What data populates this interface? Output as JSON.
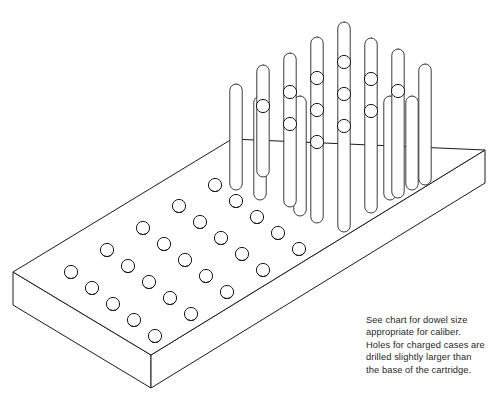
{
  "figure": {
    "caption": {
      "lines": [
        "See chart for dowel size",
        "appropriate for caliber.",
        "Holes for charged cases are",
        "drilled slightly larger than",
        "the base of the cartridge."
      ],
      "text": "See chart for dowel size\nappropriate for caliber.\nHoles for charged cases are\ndrilled slightly larger than\nthe base of the cartridge."
    },
    "colors": {
      "line": "#1a1a1a",
      "dowel_line": "#3a3a3a",
      "fill": "#ffffff",
      "background": "#ffffff",
      "text": "#1f1f1f"
    },
    "board": {
      "label": "loading block",
      "thickness_px": 33,
      "top_face_corners": [
        [
          13,
          272
        ],
        [
          232,
          139
        ],
        [
          485,
          150
        ],
        [
          151,
          355
        ]
      ],
      "front_left_edge": [
        [
          13,
          272
        ],
        [
          13,
          305
        ]
      ],
      "front_bottom_vertex": [
        151,
        388
      ],
      "right_vertex_bottom": [
        485,
        183
      ]
    },
    "holes": {
      "label": "drilled holes for charged cases",
      "count": 25,
      "radius_px": 6.6,
      "depth_arc_offset_px": 3.4,
      "grid_rows": 5,
      "grid_cols": 5,
      "centers": [
        [
          71,
          272
        ],
        [
          107,
          250
        ],
        [
          143,
          228
        ],
        [
          179,
          206
        ],
        [
          215,
          185
        ],
        [
          92,
          288
        ],
        [
          128,
          266
        ],
        [
          164,
          244
        ],
        [
          200,
          222
        ],
        [
          236,
          201
        ],
        [
          113,
          304
        ],
        [
          149,
          282
        ],
        [
          185,
          260
        ],
        [
          221,
          238
        ],
        [
          257,
          217
        ],
        [
          134,
          320
        ],
        [
          170,
          298
        ],
        [
          206,
          276
        ],
        [
          242,
          254
        ],
        [
          278,
          233
        ],
        [
          155,
          336
        ],
        [
          191,
          314
        ],
        [
          227,
          292
        ],
        [
          263,
          270
        ],
        [
          299,
          249
        ]
      ]
    },
    "dowels": {
      "label": "dowel pegs holding cartridge cases",
      "count": 12,
      "radius_px": 6.2,
      "items": [
        {
          "x": 236,
          "top_y": 84,
          "bottom_y": 190,
          "cases": []
        },
        {
          "x": 263,
          "top_y": 65,
          "bottom_y": 177,
          "cases": [
            106
          ]
        },
        {
          "x": 290,
          "top_y": 53,
          "bottom_y": 207,
          "cases": [
            92,
            124
          ]
        },
        {
          "x": 317,
          "top_y": 37,
          "bottom_y": 223,
          "cases": [
            78,
            110,
            142
          ]
        },
        {
          "x": 344,
          "top_y": 22,
          "bottom_y": 232,
          "cases": [
            62,
            94,
            126
          ]
        },
        {
          "x": 371,
          "top_y": 38,
          "bottom_y": 213,
          "cases": [
            79,
            111
          ]
        },
        {
          "x": 398,
          "top_y": 49,
          "bottom_y": 198,
          "cases": [
            91
          ]
        },
        {
          "x": 425,
          "top_y": 64,
          "bottom_y": 185,
          "cases": []
        },
        {
          "x": 260,
          "top_y": 100,
          "bottom_y": 200,
          "cases": []
        },
        {
          "x": 300,
          "top_y": 100,
          "bottom_y": 216,
          "cases": []
        },
        {
          "x": 390,
          "top_y": 100,
          "bottom_y": 200,
          "cases": []
        },
        {
          "x": 412,
          "top_y": 100,
          "bottom_y": 190,
          "cases": []
        }
      ]
    },
    "case_circles": {
      "label": "cartridge cases on dowels",
      "radius_px": 6.6
    }
  }
}
